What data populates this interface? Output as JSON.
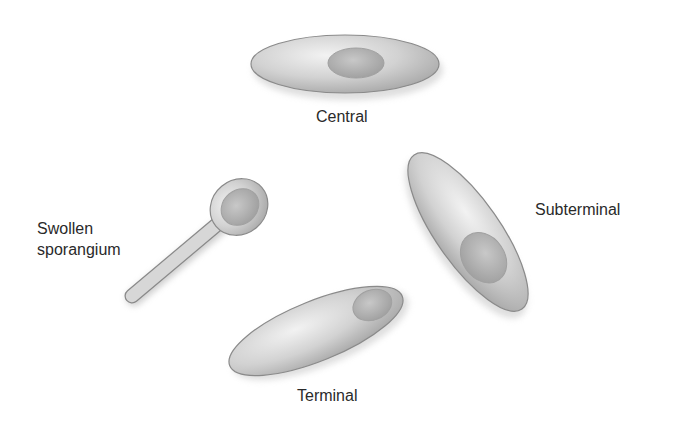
{
  "figure": {
    "labels": {
      "central": "Central",
      "subterminal": "Subterminal",
      "swollen_line1": "Swollen",
      "swollen_line2": "sporangium",
      "terminal": "Terminal"
    },
    "colors": {
      "cell_fill": "#c9c9c9",
      "cell_highlight": "#ececec",
      "cell_edge": "#8a8a8a",
      "spore_fill": "#b4b4b4",
      "text": "#2a2a2a"
    }
  }
}
